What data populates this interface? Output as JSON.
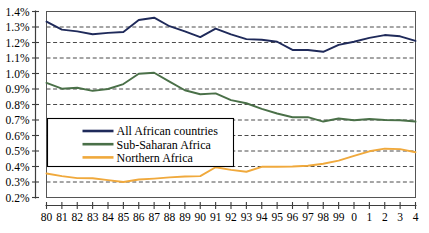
{
  "chart_data": {
    "type": "line",
    "title": "",
    "subtitle": "",
    "xlabel": "",
    "ylabel": "",
    "grid": true,
    "legend_position": "inside-left-middle",
    "x": [
      1980,
      1981,
      1982,
      1983,
      1984,
      1985,
      1986,
      1987,
      1988,
      1989,
      1990,
      1991,
      1992,
      1993,
      1994,
      1995,
      1996,
      1997,
      1998,
      1999,
      2000,
      2001,
      2002,
      2003,
      2004
    ],
    "categories": [
      "80",
      "81",
      "82",
      "83",
      "84",
      "85",
      "86",
      "87",
      "88",
      "89",
      "90",
      "91",
      "92",
      "93",
      "94",
      "95",
      "96",
      "97",
      "98",
      "99",
      "0",
      "1",
      "2",
      "3",
      "4"
    ],
    "xtick_labels": [
      "80",
      "81",
      "82",
      "83",
      "84",
      "85",
      "86",
      "87",
      "88",
      "89",
      "90",
      "91",
      "92",
      "93",
      "94",
      "95",
      "96",
      "97",
      "98",
      "99",
      "0",
      "1",
      "2",
      "3",
      "4"
    ],
    "ytick_labels": [
      "0.2%",
      "0.3%",
      "0.4%",
      "0.5%",
      "0.6%",
      "0.7%",
      "0.8%",
      "0.9%",
      "1.0%",
      "1.1%",
      "1.2%",
      "1.3%",
      "1.4%"
    ],
    "ytick_values": [
      0.2,
      0.3,
      0.4,
      0.5,
      0.6,
      0.7,
      0.8,
      0.9,
      1.0,
      1.1,
      1.2,
      1.3,
      1.4
    ],
    "ylim": [
      0.2,
      1.4
    ],
    "xlim": [
      1980,
      2004
    ],
    "units": "percent",
    "series": [
      {
        "name": "All African countries",
        "color": "#1f2a5a",
        "values": [
          1.335,
          1.283,
          1.272,
          1.253,
          1.262,
          1.268,
          1.345,
          1.36,
          1.305,
          1.272,
          1.235,
          1.29,
          1.252,
          1.222,
          1.218,
          1.205,
          1.152,
          1.152,
          1.14,
          1.185,
          1.205,
          1.23,
          1.248,
          1.24,
          1.21
        ]
      },
      {
        "name": "Sub-Saharan Africa",
        "color": "#4a7048",
        "values": [
          0.94,
          0.902,
          0.908,
          0.888,
          0.9,
          0.932,
          0.998,
          1.005,
          0.948,
          0.892,
          0.866,
          0.872,
          0.828,
          0.808,
          0.772,
          0.742,
          0.718,
          0.718,
          0.69,
          0.71,
          0.698,
          0.706,
          0.7,
          0.698,
          0.69
        ]
      },
      {
        "name": "Northern Africa",
        "color": "#f0a93c",
        "values": [
          0.355,
          0.338,
          0.325,
          0.324,
          0.312,
          0.3,
          0.316,
          0.322,
          0.33,
          0.335,
          0.338,
          0.395,
          0.378,
          0.366,
          0.398,
          0.398,
          0.4,
          0.405,
          0.418,
          0.438,
          0.468,
          0.498,
          0.515,
          0.512,
          0.492
        ]
      }
    ]
  },
  "legend": {
    "items": [
      {
        "label": "All African countries",
        "color": "#1f2a5a"
      },
      {
        "label": "Sub-Saharan Africa",
        "color": "#4a7048"
      },
      {
        "label": "Northern Africa",
        "color": "#f0a93c"
      }
    ]
  },
  "colors": {
    "all_african": "#1f2a5a",
    "sub_saharan": "#4a7048",
    "northern": "#f0a93c",
    "grid": "#4a4a4a",
    "axis": "#3d3d3d",
    "background": "#ffffff"
  }
}
